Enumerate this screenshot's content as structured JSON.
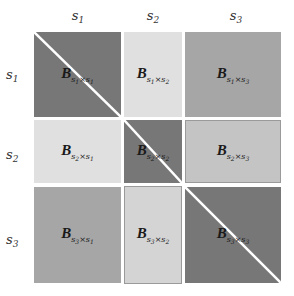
{
  "column_headers": [
    {
      "base": "s",
      "sub": "1"
    },
    {
      "base": "s",
      "sub": "2"
    },
    {
      "base": "s",
      "sub": "3"
    }
  ],
  "row_headers": [
    {
      "base": "s",
      "sub": "1"
    },
    {
      "base": "s",
      "sub": "2"
    },
    {
      "base": "s",
      "sub": "3"
    }
  ],
  "blocks": [
    [
      {
        "symbol": "B",
        "row": "1",
        "col": "1",
        "fill": "#777777",
        "diagonal": true
      },
      {
        "symbol": "B",
        "row": "1",
        "col": "2",
        "fill": "#e0e0e0",
        "diagonal": false
      },
      {
        "symbol": "B",
        "row": "1",
        "col": "3",
        "fill": "#a6a6a6",
        "diagonal": false
      }
    ],
    [
      {
        "symbol": "B",
        "row": "2",
        "col": "1",
        "fill": "#e0e0e0",
        "diagonal": false
      },
      {
        "symbol": "B",
        "row": "2",
        "col": "2",
        "fill": "#777777",
        "diagonal": true
      },
      {
        "symbol": "B",
        "row": "2",
        "col": "3",
        "fill": "#c4c4c4",
        "diagonal": false
      }
    ],
    [
      {
        "symbol": "B",
        "row": "3",
        "col": "1",
        "fill": "#a6a6a6",
        "diagonal": false
      },
      {
        "symbol": "B",
        "row": "3",
        "col": "2",
        "fill": "#d4d4d4",
        "diagonal": false
      },
      {
        "symbol": "B",
        "row": "3",
        "col": "3",
        "fill": "#777777",
        "diagonal": true
      }
    ]
  ],
  "separator": "×",
  "subscript_base": "s",
  "diagonal_line_color": "#ffffff"
}
